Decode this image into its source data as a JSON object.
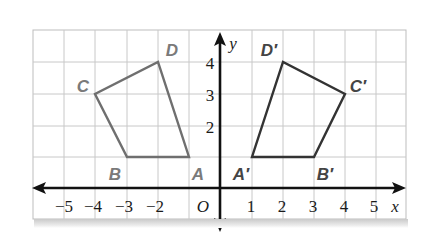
{
  "figure": {
    "axes": {
      "x_label": "x",
      "y_label": "y",
      "origin_label": "O",
      "x_ticks": [
        "−5",
        "−4",
        "−3",
        "−2",
        "1",
        "2",
        "3",
        "4",
        "5"
      ],
      "y_ticks": [
        "2",
        "3",
        "4"
      ],
      "x_range": [
        -6,
        6
      ],
      "y_range": [
        -1,
        5
      ]
    },
    "preimage": {
      "name": "ABCD",
      "color": "#6f6f6f",
      "vertices": [
        {
          "label": "A",
          "x": -1,
          "y": 1
        },
        {
          "label": "B",
          "x": -3,
          "y": 1
        },
        {
          "label": "C",
          "x": -4,
          "y": 3
        },
        {
          "label": "D",
          "x": -2,
          "y": 4
        }
      ]
    },
    "image": {
      "name": "A′B′C′D′",
      "color": "#333333",
      "vertices": [
        {
          "label": "A′",
          "x": 1,
          "y": 1
        },
        {
          "label": "B′",
          "x": 3,
          "y": 1
        },
        {
          "label": "C′",
          "x": 4,
          "y": 3
        },
        {
          "label": "D′",
          "x": 2,
          "y": 4
        }
      ]
    },
    "colors": {
      "grid": "#c8c8c8",
      "axis": "#111111",
      "preimage_label": "#7a7a7a",
      "image_label": "#444444"
    }
  }
}
